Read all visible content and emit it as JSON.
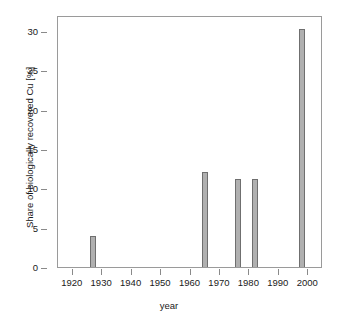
{
  "figure": {
    "background_color": "#ffffff",
    "top_caption_fragment": "",
    "plot_box_color": "#9a9a9a"
  },
  "chart_data": {
    "type": "bar",
    "title": "",
    "subtitle": "",
    "xlabel": "year",
    "ylabel": "Share of biologically recovered Cu [%]",
    "x": [
      1927,
      1965,
      1976,
      1982,
      1998
    ],
    "values": [
      4.0,
      12.1,
      11.2,
      11.2,
      30.2
    ],
    "categories": [
      "1927",
      "1965",
      "1976",
      "1982",
      "1998"
    ],
    "series": [
      {
        "name": "Share of biologically recovered Cu",
        "values": [
          4.0,
          12.1,
          11.2,
          11.2,
          30.2
        ]
      }
    ],
    "xlim": [
      1915,
      2005
    ],
    "ylim": [
      0,
      32
    ],
    "x_ticks": [
      1920,
      1930,
      1940,
      1950,
      1960,
      1970,
      1980,
      1990,
      2000
    ],
    "x_tick_labels": [
      "1920",
      "1930",
      "1940",
      "1950",
      "1960",
      "1970",
      "1980",
      "1990",
      "2000"
    ],
    "y_ticks": [
      0,
      5,
      10,
      15,
      20,
      25,
      30
    ],
    "y_tick_labels": [
      "0",
      "5",
      "10",
      "15",
      "20",
      "25",
      "30"
    ],
    "grid": false,
    "legend": false,
    "legend_position": "none",
    "bar_fill_color": "#b0b0b0",
    "bar_edge_color": "#6f6f6f",
    "bar_width_years": 2,
    "annotations": []
  }
}
